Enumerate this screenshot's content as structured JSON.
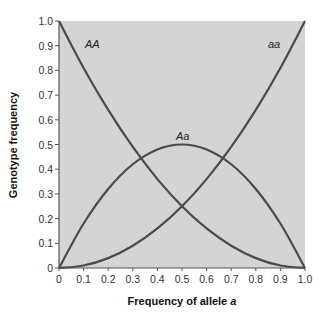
{
  "chart_data": {
    "type": "line",
    "title": "",
    "xlabel": "Frequency of allele a",
    "xlabel_prefix": "Frequency of allele ",
    "xlabel_italic": "a",
    "ylabel": "Genotype frequency",
    "xlim": [
      0,
      1.0
    ],
    "ylim": [
      0,
      1.0
    ],
    "grid": false,
    "legend": "none (inline curve labels)",
    "x_ticks": [
      "0",
      "0.1",
      "0.2",
      "0.3",
      "0.4",
      "0.5",
      "0.6",
      "0.7",
      "0.8",
      "0.9",
      "1.0"
    ],
    "y_ticks": [
      "0",
      "0.1",
      "0.2",
      "0.3",
      "0.4",
      "0.5",
      "0.6",
      "0.7",
      "0.8",
      "0.9",
      "1.0"
    ],
    "x": [
      0,
      0.1,
      0.2,
      0.3,
      0.4,
      0.5,
      0.6,
      0.7,
      0.8,
      0.9,
      1.0
    ],
    "series": [
      {
        "name": "AA",
        "values": [
          1.0,
          0.81,
          0.64,
          0.49,
          0.36,
          0.25,
          0.16,
          0.09,
          0.04,
          0.01,
          0.0
        ]
      },
      {
        "name": "Aa",
        "values": [
          0.0,
          0.18,
          0.32,
          0.42,
          0.48,
          0.5,
          0.48,
          0.42,
          0.32,
          0.18,
          0.0
        ]
      },
      {
        "name": "aa",
        "values": [
          0.0,
          0.01,
          0.04,
          0.09,
          0.16,
          0.25,
          0.36,
          0.49,
          0.64,
          0.81,
          1.0
        ]
      }
    ],
    "labels": {
      "AA": "AA",
      "Aa": "Aa",
      "aa": "aa"
    },
    "colors": {
      "background": "#d4d4d4",
      "line": "#4a4a4a",
      "axis": "#555555"
    }
  }
}
